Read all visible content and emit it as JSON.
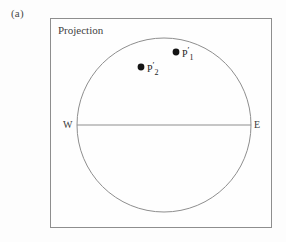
{
  "figure": {
    "panel_label": "(a)",
    "title": "Projection",
    "background_color": "#fdfdfd",
    "line_color": "#8e8e8e",
    "marker_color": "#141414",
    "text_color": "#3a3a3a"
  },
  "plot_box": {
    "x": 50,
    "y": 18,
    "width": 222,
    "height": 210,
    "border_color": "#8e8e8e"
  },
  "chart_data": {
    "type": "scatter",
    "title": "Projection",
    "xlabel": "",
    "ylabel": "",
    "grid": false,
    "legend": null,
    "projection_circle": {
      "center_x": 164,
      "center_y": 125,
      "radius": 87,
      "stroke": "#8e8e8e"
    },
    "equator_line": {
      "x1": 77,
      "y1": 125,
      "x2": 251,
      "y2": 125,
      "stroke": "#8e8e8e"
    },
    "direction_labels": [
      {
        "name": "west",
        "text": "W",
        "x": 63,
        "y": 119
      },
      {
        "name": "east",
        "text": "E",
        "x": 254,
        "y": 119
      }
    ],
    "points": [
      {
        "name": "p1-prime",
        "label_base": "P",
        "label_prime": "′",
        "label_subscript": "1",
        "cx": 176,
        "cy": 52,
        "r": 3.4,
        "color": "#141414"
      },
      {
        "name": "p2-prime",
        "label_base": "P",
        "label_prime": "′",
        "label_subscript": "2",
        "cx": 141,
        "cy": 67,
        "r": 3.4,
        "color": "#141414"
      }
    ]
  }
}
